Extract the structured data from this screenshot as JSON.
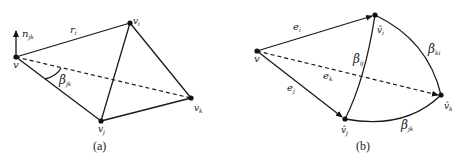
{
  "figure": {
    "panel_a": {
      "caption": "(a)",
      "vertices": {
        "v": "v",
        "vi": {
          "base": "v",
          "sub": "i"
        },
        "vj": {
          "base": "v",
          "sub": "j"
        },
        "vk": {
          "base": "v",
          "sub": "k"
        }
      },
      "labels": {
        "normal": {
          "base": "n",
          "sub": "jk"
        },
        "edge_r": {
          "base": "r",
          "sub": "i"
        },
        "angle": {
          "base": "β",
          "sub": "jk"
        }
      }
    },
    "panel_b": {
      "caption": "(b)",
      "vertices": {
        "v": "v",
        "vi": {
          "base": "v̂",
          "sub": "i"
        },
        "vj": {
          "base": "v̂",
          "sub": "j"
        },
        "vk": {
          "base": "v̂",
          "sub": "k"
        }
      },
      "labels": {
        "e_i": {
          "base": "e",
          "sub": "i"
        },
        "e_j": {
          "base": "e",
          "sub": "j"
        },
        "e_k": {
          "base": "e",
          "sub": "k"
        },
        "beta_ij": {
          "base": "β",
          "sub": "ij"
        },
        "beta_ki": {
          "base": "β",
          "sub": "ki"
        },
        "beta_jk": {
          "base": "β",
          "sub": "jk"
        }
      }
    }
  }
}
